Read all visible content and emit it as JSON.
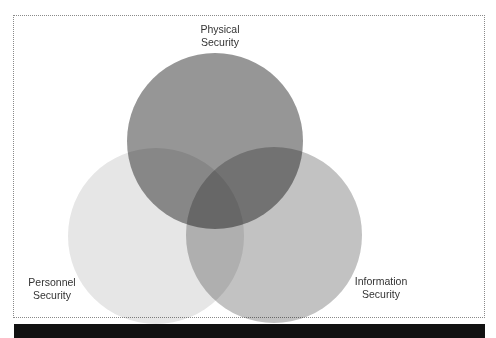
{
  "diagram": {
    "type": "venn",
    "sets": [
      {
        "id": "physical",
        "label_line1": "Physical",
        "label_line2": "Security",
        "fill": "#8a8a8a",
        "cx": 215,
        "cy": 141,
        "r": 88
      },
      {
        "id": "personnel",
        "label_line1": "Personnel",
        "label_line2": "Security",
        "fill": "#e6e6e6",
        "cx": 156,
        "cy": 236,
        "r": 88
      },
      {
        "id": "information",
        "label_line1": "Information",
        "label_line2": "Security",
        "fill": "#c2c2c2",
        "cx": 274,
        "cy": 235,
        "r": 88
      }
    ],
    "border_color": "#8a8a8a",
    "bar_color": "#111111"
  }
}
